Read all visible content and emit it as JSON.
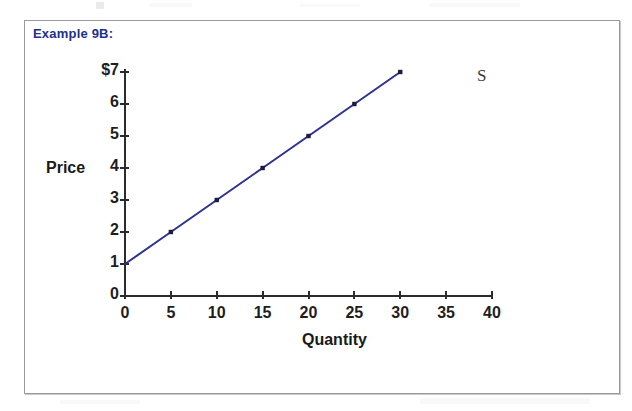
{
  "page": {
    "background_color": "#ffffff"
  },
  "example_box": {
    "title": "Example 9B:",
    "title_color": "#22308c",
    "border_color": "#9a9a9a"
  },
  "chart_data": {
    "type": "line",
    "title": "",
    "xlabel": "Quantity",
    "ylabel": "Price",
    "xlim": [
      0,
      40
    ],
    "ylim": [
      0,
      7
    ],
    "xticks": [
      "0",
      "5",
      "10",
      "15",
      "20",
      "25",
      "30",
      "35",
      "40"
    ],
    "yticks": [
      "0",
      "1",
      "2",
      "3",
      "4",
      "5",
      "6",
      "$7"
    ],
    "grid": false,
    "legend": "none",
    "series": [
      {
        "name": "S",
        "label": "S",
        "color": "#2f3192",
        "marker": "square",
        "x": [
          0,
          5,
          10,
          15,
          20,
          25,
          30
        ],
        "values": [
          1,
          2,
          3,
          4,
          5,
          6,
          7
        ]
      }
    ],
    "annotations": [
      {
        "text": "S",
        "x": 31.5,
        "y": 6.9
      }
    ]
  }
}
